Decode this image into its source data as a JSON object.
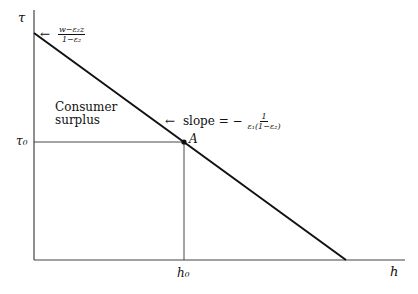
{
  "diagram": {
    "axes": {
      "y_label": "τ",
      "x_label": "h",
      "origin": [
        34,
        260
      ],
      "y_top": 10,
      "x_right": 405
    },
    "demand_line": {
      "start": [
        34,
        33
      ],
      "end": [
        346,
        260
      ]
    },
    "point_A": {
      "label": "A",
      "position": [
        184,
        142
      ]
    },
    "annotations": {
      "intercept": {
        "arrow": "←",
        "numerator": "w−ε₂z",
        "denominator": "1−ε₂"
      },
      "slope": {
        "arrow": "←",
        "prefix": "slope = −",
        "numerator": "1",
        "denominator": "ε₁(1−ε₂)"
      },
      "region": {
        "line1": "Consumer",
        "line2": "surplus"
      }
    },
    "ticks": {
      "tau0": "τ₀",
      "h0": "h₀"
    },
    "colors": {
      "line": "#111111",
      "axis": "#444444",
      "guide": "#333333"
    }
  }
}
